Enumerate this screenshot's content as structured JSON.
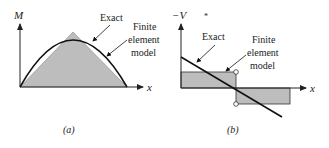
{
  "figure": {
    "panels": [
      {
        "id": "a",
        "caption": "(a)",
        "y_axis_label": "M",
        "x_axis_label": "x",
        "exact_label": "Exact",
        "fe_label_lines": [
          "Finite",
          "element",
          "model"
        ],
        "description": "Bending moment: exact parabola vs. piecewise-linear finite element model (triangle)"
      },
      {
        "id": "b",
        "caption": "(b)",
        "y_axis_label": "−V",
        "x_axis_label": "x",
        "exact_label": "Exact",
        "fe_label_lines": [
          "Finite",
          "element",
          "model"
        ],
        "stray_mark": "*",
        "description": "Shear force: exact linear variation vs. piecewise-constant finite element model with jump at midspan"
      }
    ],
    "colors": {
      "line": "#111111",
      "fill": "#bdbdbd",
      "axis": "#222222",
      "background": "#ffffff"
    }
  }
}
